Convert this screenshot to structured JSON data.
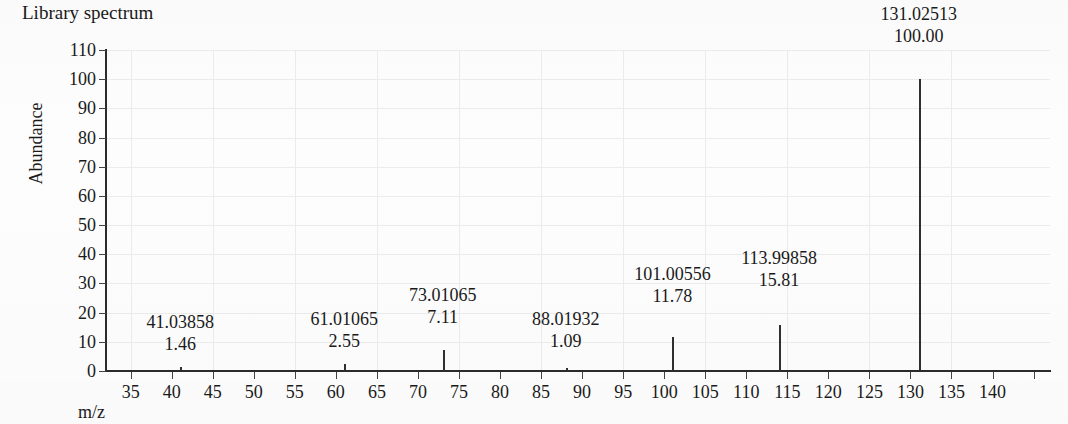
{
  "chart_data": {
    "type": "bar",
    "title": "Library spectrum",
    "xlabel": "m/z",
    "ylabel": "Abundance",
    "xlim": [
      32,
      147
    ],
    "ylim": [
      0,
      110
    ],
    "grid": true,
    "legend": "none",
    "x_ticks": [
      35,
      40,
      45,
      50,
      55,
      60,
      65,
      70,
      75,
      80,
      85,
      90,
      95,
      100,
      105,
      110,
      115,
      120,
      125,
      130,
      135,
      140
    ],
    "x_tick_labels": [
      "35",
      "40",
      "45",
      "50",
      "55",
      "60",
      "65",
      "70",
      "75",
      "80",
      "85",
      "90",
      "95",
      "100",
      "105",
      "110",
      "115",
      "120",
      "125",
      "130",
      "135",
      "140"
    ],
    "y_ticks": [
      0,
      10,
      20,
      30,
      40,
      50,
      60,
      70,
      80,
      90,
      100,
      110
    ],
    "y_tick_labels": [
      "0",
      "10",
      "20",
      "30",
      "40",
      "50",
      "60",
      "70",
      "80",
      "90",
      "100",
      "110"
    ],
    "peaks": [
      {
        "mz": 41.03858,
        "mz_label": "41.03858",
        "intensity": 1.46,
        "intensity_label": "1.46",
        "label_y_offset": 56
      },
      {
        "mz": 61.01065,
        "mz_label": "61.01065",
        "intensity": 2.55,
        "intensity_label": "2.55",
        "label_y_offset": 56
      },
      {
        "mz": 73.01065,
        "mz_label": "73.01065",
        "intensity": 7.11,
        "intensity_label": "7.11",
        "label_y_offset": 66
      },
      {
        "mz": 88.01932,
        "mz_label": "88.01932",
        "intensity": 1.09,
        "intensity_label": "1.09",
        "label_y_offset": 60
      },
      {
        "mz": 101.00556,
        "mz_label": "101.00556",
        "intensity": 11.78,
        "intensity_label": "11.78",
        "label_y_offset": 74
      },
      {
        "mz": 113.99858,
        "mz_label": "113.99858",
        "intensity": 15.81,
        "intensity_label": "15.81",
        "label_y_offset": 78
      },
      {
        "mz": 131.02513,
        "mz_label": "131.02513",
        "intensity": 100.0,
        "intensity_label": "100.00",
        "label_y_offset": 76
      }
    ],
    "colors": {
      "stem": "#2f2f2f",
      "axis": "#2b2b2b",
      "grid": "#ececec",
      "text": "#1a1a1a",
      "background": "#fdfdfd"
    }
  }
}
